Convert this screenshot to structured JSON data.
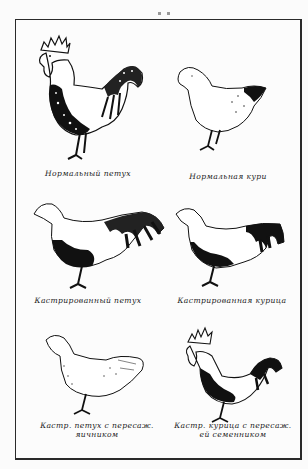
{
  "figure": {
    "panels": [
      {
        "id": "normal-rooster",
        "caption": "Нормальный петух",
        "illustration": "rooster-drawing"
      },
      {
        "id": "normal-hen",
        "caption": "Нормальная кури",
        "illustration": "hen-drawing"
      },
      {
        "id": "castrated-rooster",
        "caption": "Кастрированный петух",
        "illustration": "capon-drawing"
      },
      {
        "id": "castrated-hen",
        "caption": "Кастрированная курица",
        "illustration": "castrated-hen-drawing"
      },
      {
        "id": "castrated-rooster-ovary",
        "caption_line1": "Кастр. петух с пересаж.",
        "caption_line2": "яичником",
        "illustration": "feminized-rooster-drawing"
      },
      {
        "id": "castrated-hen-testis",
        "caption_line1": "Кастр. курица с пересаж.",
        "caption_line2": "ей семенником",
        "illustration": "masculinized-hen-drawing"
      }
    ]
  }
}
